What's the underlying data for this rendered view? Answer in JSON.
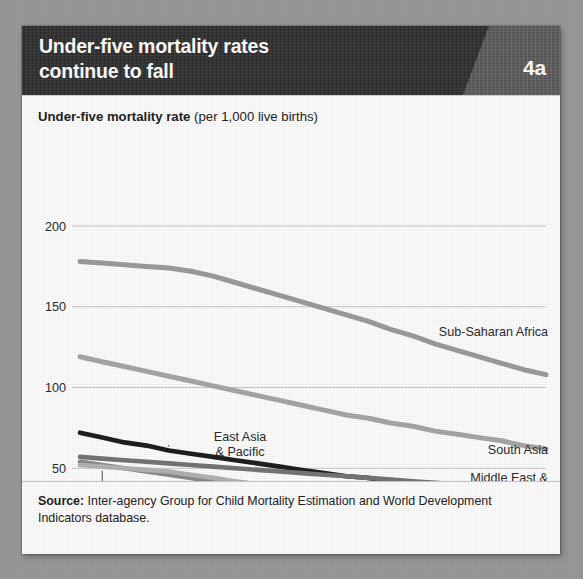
{
  "figure": {
    "title_line1": "Under-five mortality rates",
    "title_line2": "continue to fall",
    "badge": "4a",
    "subtitle_bold": "Under-five mortality rate",
    "subtitle_regular": " (per 1,000 live births)",
    "source_label": "Source:",
    "source_text": " Inter-agency Group for Child Mortality Estimation and World Development Indicators database.",
    "colors": {
      "background": "#9b9b9b",
      "card": "#ffffff",
      "header_bar": "#2f2f2f",
      "badge_panel": "#5b5b5b",
      "gridline": "#c8c8c8",
      "text": "#242424"
    }
  },
  "chart_data": {
    "type": "line",
    "title": "Under-five mortality rate (per 1,000 live births)",
    "xlabel": "",
    "ylabel": "Under-five mortality rate (per 1,000 live births)",
    "xlim": [
      1990,
      2011
    ],
    "ylim": [
      0,
      200
    ],
    "yticks": [
      0,
      50,
      100,
      150,
      200
    ],
    "ytick_labels": [
      "0",
      "50",
      "100",
      "150",
      "200"
    ],
    "xticks": [
      1990,
      1995,
      2000,
      2005,
      2011
    ],
    "xtick_labels": [
      "1990",
      "1995",
      "2000",
      "2005",
      "2011"
    ],
    "grid": "horizontal",
    "legend": "inline-labels",
    "x": [
      1990,
      1991,
      1992,
      1993,
      1994,
      1995,
      1996,
      1997,
      1998,
      1999,
      2000,
      2001,
      2002,
      2003,
      2004,
      2005,
      2006,
      2007,
      2008,
      2009,
      2010,
      2011
    ],
    "series": [
      {
        "name": "Sub-Saharan Africa",
        "color": "#9d9d9d",
        "width": 5.0,
        "label_position": "right",
        "values": [
          178,
          177,
          176,
          175,
          174,
          172,
          169,
          165,
          161,
          157,
          153,
          149,
          145,
          141,
          136,
          132,
          127,
          123,
          119,
          115,
          111,
          108
        ]
      },
      {
        "name": "South Asia",
        "color": "#a8a8a8",
        "width": 5.0,
        "label_position": "right",
        "values": [
          119,
          116,
          113,
          110,
          107,
          104,
          101,
          98,
          95,
          92,
          89,
          86,
          83,
          81,
          78,
          76,
          73,
          71,
          69,
          67,
          64,
          62
        ]
      },
      {
        "name": "East Asia & Pacific",
        "color": "#1f1f1f",
        "width": 4.6,
        "label_position": "callout-top",
        "values": [
          72,
          69,
          66,
          64,
          61,
          59,
          57,
          55,
          53,
          51,
          49,
          47,
          45,
          44,
          42,
          41,
          39,
          38,
          36,
          35,
          33,
          32
        ]
      },
      {
        "name": "Middle East & North Africa",
        "color": "#767676",
        "width": 4.6,
        "label_position": "right",
        "values": [
          57,
          56,
          55,
          54,
          53,
          52,
          51,
          50,
          49,
          48,
          47,
          46,
          45,
          44,
          43,
          42,
          41,
          40,
          39,
          38,
          37,
          36
        ]
      },
      {
        "name": "Latin America & Caribbean",
        "color": "#8a8a8a",
        "width": 4.6,
        "label_position": "callout-bottom",
        "values": [
          54,
          52,
          50,
          48,
          46,
          44,
          42,
          40,
          38,
          37,
          35,
          34,
          32,
          31,
          30,
          29,
          28,
          27,
          26,
          25,
          24,
          23
        ]
      },
      {
        "name": "Europe & Central Asia",
        "color": "#b4b4b4",
        "width": 4.6,
        "label_position": "callout-bottom",
        "values": [
          52,
          51,
          50,
          49,
          48,
          46,
          44,
          42,
          40,
          38,
          36,
          34,
          33,
          31,
          30,
          28,
          27,
          25,
          24,
          22,
          21,
          20
        ]
      }
    ],
    "annotations": [
      {
        "text_line1": "Sub-Saharan Africa",
        "text_line2": "",
        "series": "Sub-Saharan Africa"
      },
      {
        "text_line1": "South Asia",
        "text_line2": "",
        "series": "South Asia"
      },
      {
        "text_line1": "Middle East &",
        "text_line2": "North Africa",
        "series": "Middle East & North Africa"
      },
      {
        "text_line1": "East Asia",
        "text_line2": "& Pacific",
        "series": "East Asia & Pacific"
      },
      {
        "text_line1": "Europe &",
        "text_line2": "Central Asia",
        "series": "Europe & Central Asia"
      },
      {
        "text_line1": "Latin America",
        "text_line2": "& Caribbean",
        "series": "Latin America & Caribbean"
      }
    ]
  }
}
